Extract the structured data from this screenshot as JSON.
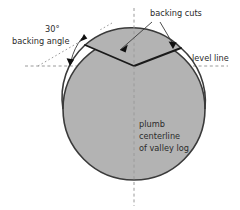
{
  "figure": {
    "background_color": "#ffffff",
    "log_fill_color": "#b3b3b3",
    "log_stroke_color": "#3a3a3a",
    "cut_stroke_color": "#1a1a1a",
    "dashed_line_color": "#8a8a8a",
    "text_color": "#2b2b2b"
  },
  "labels": {
    "backing_cuts": "backing cuts",
    "angle_value": "30°",
    "angle_name": "backing angle",
    "level_line": "level line",
    "centerline_line1": "plumb",
    "centerline_line2": "centerline",
    "centerline_line3": "of valley log"
  },
  "geometry": {
    "log_center_x": 134,
    "log_center_y": 109,
    "log_radius": 71,
    "level_line_y": 66,
    "level_line_x_start": 25,
    "level_line_x_end": 228,
    "centerline_x": 134,
    "centerline_y_top": 8,
    "centerline_y_bottom": 206,
    "notch_apex_x": 134,
    "notch_apex_y": 66,
    "notch_left_x": 85,
    "notch_left_y": 45,
    "notch_right_x": 181,
    "notch_right_y": 48,
    "backing_angle_degrees": 30
  }
}
